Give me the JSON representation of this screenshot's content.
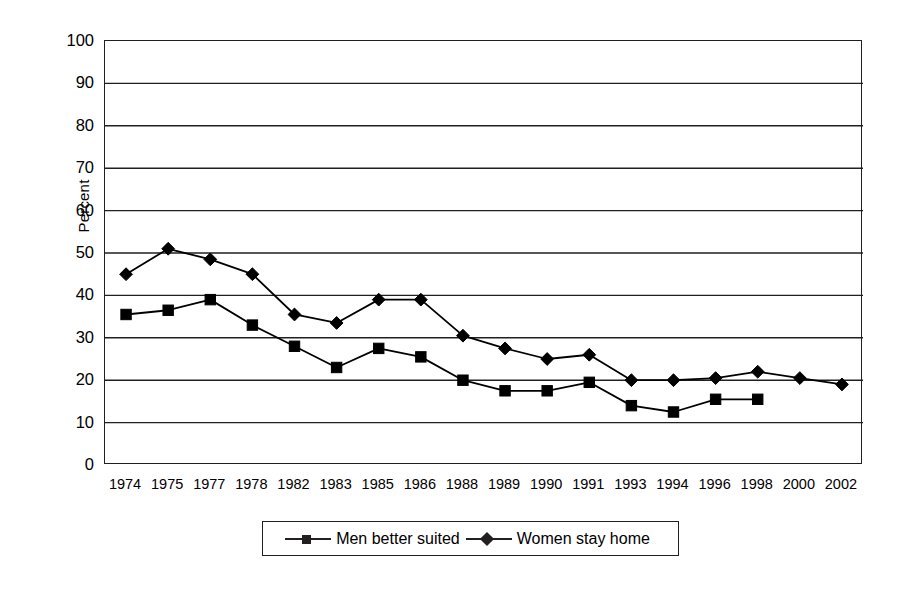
{
  "chart_data": {
    "type": "line",
    "title": "",
    "xlabel": "",
    "ylabel": "Percent",
    "ylim": [
      0,
      100
    ],
    "ytick_step": 10,
    "grid": "horizontal",
    "legend_position": "bottom",
    "categories": [
      "1974",
      "1975",
      "1977",
      "1978",
      "1982",
      "1983",
      "1985",
      "1986",
      "1988",
      "1989",
      "1990",
      "1991",
      "1993",
      "1994",
      "1996",
      "1998",
      "2000",
      "2002"
    ],
    "yticks": [
      "0",
      "10",
      "20",
      "30",
      "40",
      "50",
      "60",
      "70",
      "80",
      "90",
      "100"
    ],
    "series": [
      {
        "name": "Men better suited",
        "marker": "square",
        "color": "#000000",
        "values": [
          35.5,
          36.5,
          39,
          33,
          28,
          23,
          27.5,
          25.5,
          20,
          17.5,
          17.5,
          19.5,
          14,
          12.5,
          15.5,
          15.5,
          null,
          null
        ]
      },
      {
        "name": "Women stay home",
        "marker": "diamond",
        "color": "#000000",
        "values": [
          45,
          51,
          48.5,
          45,
          35.5,
          33.5,
          39,
          39,
          30.5,
          27.5,
          25,
          26,
          20,
          20,
          20.5,
          22,
          20.5,
          19
        ]
      }
    ]
  },
  "legend": {
    "entries": [
      {
        "label": "Men better suited",
        "marker": "square"
      },
      {
        "label": "Women stay home",
        "marker": "diamond"
      }
    ]
  }
}
